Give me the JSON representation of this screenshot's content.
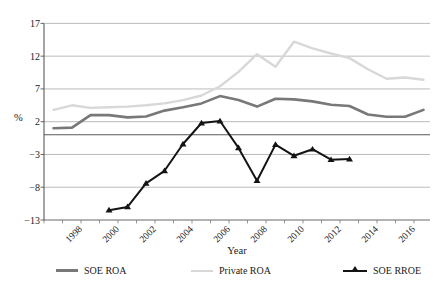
{
  "axes": {
    "ylabel": "%",
    "xlabel": "Year"
  },
  "legend": {
    "items": [
      {
        "label": "SOE ROA",
        "color": "#787878",
        "marker": "none"
      },
      {
        "label": "Private ROA",
        "color": "#d8d8d8",
        "marker": "none"
      },
      {
        "label": "SOE RROE",
        "color": "#141414",
        "marker": "triangle"
      }
    ]
  },
  "chart_data": {
    "type": "line",
    "title": "",
    "xlabel": "Year",
    "ylabel": "%",
    "ylim": [
      -13,
      17
    ],
    "yticks": [
      17,
      12,
      7,
      2,
      -3,
      -8,
      -13
    ],
    "ytick_labels": [
      "17",
      "12",
      "7",
      "2",
      "−3",
      "−8",
      "−13"
    ],
    "xtick_years": [
      1998,
      2000,
      2002,
      2004,
      2006,
      2008,
      2010,
      2012,
      2014,
      2016
    ],
    "xtick_labels": [
      "1998",
      "2000",
      "2002",
      "2004",
      "2006",
      "2008",
      "2010",
      "2012",
      "2014",
      "2016"
    ],
    "grid": "horizontal-gridlines",
    "zero_axis_line": true,
    "legend_position": "bottom",
    "series": [
      {
        "name": "SOE ROA",
        "color": "#787878",
        "width": 2.6,
        "marker": "none",
        "x": [
          1997,
          1998,
          1999,
          2000,
          2001,
          2002,
          2003,
          2004,
          2005,
          2006,
          2007,
          2008,
          2009,
          2010,
          2011,
          2012,
          2013,
          2014,
          2015,
          2016,
          2017
        ],
        "y": [
          1.0,
          1.1,
          3.0,
          3.0,
          2.65,
          2.8,
          3.7,
          4.2,
          4.8,
          5.9,
          5.3,
          4.3,
          5.5,
          5.4,
          5.1,
          4.6,
          4.4,
          3.1,
          2.75,
          2.75,
          3.8
        ]
      },
      {
        "name": "Private ROA",
        "color": "#d8d8d8",
        "width": 2.4,
        "marker": "none",
        "x": [
          1997,
          1998,
          1999,
          2000,
          2001,
          2002,
          2003,
          2004,
          2005,
          2006,
          2007,
          2008,
          2009,
          2010,
          2011,
          2012,
          2013,
          2014,
          2015,
          2016,
          2017
        ],
        "y": [
          3.8,
          4.5,
          4.1,
          4.2,
          4.3,
          4.5,
          4.8,
          5.3,
          6.0,
          7.4,
          9.6,
          12.3,
          10.4,
          14.2,
          13.2,
          12.4,
          11.7,
          10.0,
          8.55,
          8.75,
          8.4
        ]
      },
      {
        "name": "SOE RROE",
        "color": "#141414",
        "width": 2.0,
        "marker": "triangle",
        "x": [
          2000,
          2001,
          2002,
          2003,
          2004,
          2005,
          2006,
          2007,
          2008,
          2009,
          2010,
          2011,
          2012,
          2013
        ],
        "y": [
          -11.5,
          -11.0,
          -7.4,
          -5.5,
          -1.4,
          1.8,
          2.1,
          -2.0,
          -7.0,
          -1.5,
          -3.2,
          -2.2,
          -3.8,
          -3.7
        ]
      }
    ]
  }
}
